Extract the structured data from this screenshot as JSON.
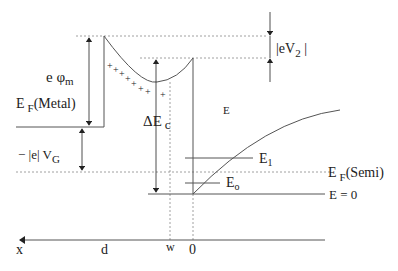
{
  "diagram": {
    "type": "energy-band-diagram",
    "labels": {
      "e_phi_m": "e φ",
      "e_phi_m_sub": "m",
      "ef_metal_main": "E",
      "ef_metal_sub": "F",
      "ef_metal_suffix": "(Metal)",
      "delta_ec_main": "ΔE",
      "delta_ec_sub": "c",
      "ev2_main": "|eV",
      "ev2_sub": "2",
      "ev2_suffix": " |",
      "vg_main": "− |e| V",
      "vg_sub": "G",
      "e_label": "E",
      "e1_main": "E",
      "e1_sub": "1",
      "ef_semi_main": "E",
      "ef_semi_sub": "F",
      "ef_semi_suffix": "(Semi)",
      "eo_main": "E",
      "eo_sub": "o",
      "e_zero": "E = 0",
      "axis_x": "x",
      "axis_d": "d",
      "axis_w": "w",
      "axis_0": "0"
    },
    "colors": {
      "line": "#555555",
      "dashed": "#888888",
      "text": "#222222"
    },
    "charges": "+ + + + + + + + +"
  }
}
